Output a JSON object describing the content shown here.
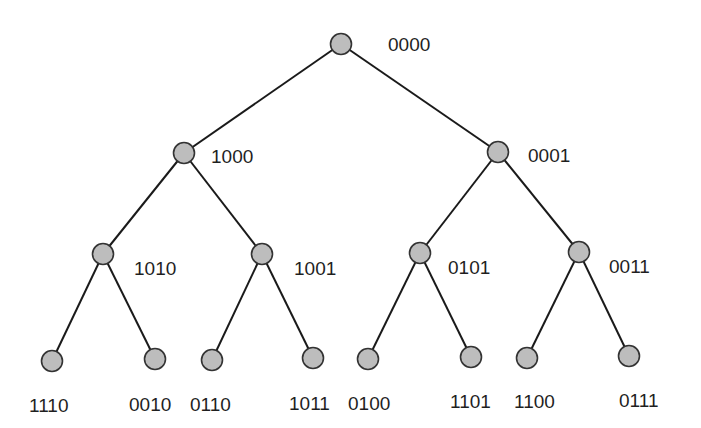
{
  "diagram": {
    "type": "binary-tree",
    "colors": {
      "node_fill": "#bdbdbd",
      "node_stroke": "#333333",
      "edge": "#1a1a1a",
      "text": "#1f1f1f"
    },
    "nodes": [
      {
        "id": "n0",
        "label": "0000",
        "x": 341,
        "y": 44,
        "lx": 388,
        "ly": 35
      },
      {
        "id": "n1",
        "label": "1000",
        "x": 184,
        "y": 153,
        "lx": 211,
        "ly": 147
      },
      {
        "id": "n2",
        "label": "0001",
        "x": 498,
        "y": 152,
        "lx": 528,
        "ly": 146
      },
      {
        "id": "n3",
        "label": "1010",
        "x": 103,
        "y": 254,
        "lx": 134,
        "ly": 259
      },
      {
        "id": "n4",
        "label": "1001",
        "x": 262,
        "y": 254,
        "lx": 294,
        "ly": 259
      },
      {
        "id": "n5",
        "label": "0101",
        "x": 420,
        "y": 253,
        "lx": 448,
        "ly": 258
      },
      {
        "id": "n6",
        "label": "0011",
        "x": 579,
        "y": 252,
        "lx": 609,
        "ly": 257
      },
      {
        "id": "n7",
        "label": "1110",
        "x": 52,
        "y": 361,
        "lx": 29,
        "ly": 396
      },
      {
        "id": "n8",
        "label": "0010",
        "x": 155,
        "y": 359,
        "lx": 129,
        "ly": 395
      },
      {
        "id": "n9",
        "label": "0110",
        "x": 212,
        "y": 360,
        "lx": 190,
        "ly": 395
      },
      {
        "id": "n10",
        "label": "1011",
        "x": 313,
        "y": 358,
        "lx": 289,
        "ly": 394
      },
      {
        "id": "n11",
        "label": "0100",
        "x": 368,
        "y": 359,
        "lx": 348,
        "ly": 394
      },
      {
        "id": "n12",
        "label": "1101",
        "x": 471,
        "y": 357,
        "lx": 450,
        "ly": 392
      },
      {
        "id": "n13",
        "label": "1100",
        "x": 527,
        "y": 358,
        "lx": 514,
        "ly": 392
      },
      {
        "id": "n14",
        "label": "0111",
        "x": 629,
        "y": 356,
        "lx": 619,
        "ly": 391
      }
    ],
    "edges": [
      [
        "n0",
        "n1"
      ],
      [
        "n0",
        "n2"
      ],
      [
        "n1",
        "n3"
      ],
      [
        "n1",
        "n4"
      ],
      [
        "n2",
        "n5"
      ],
      [
        "n2",
        "n6"
      ],
      [
        "n3",
        "n7"
      ],
      [
        "n3",
        "n8"
      ],
      [
        "n4",
        "n9"
      ],
      [
        "n4",
        "n10"
      ],
      [
        "n5",
        "n11"
      ],
      [
        "n5",
        "n12"
      ],
      [
        "n6",
        "n13"
      ],
      [
        "n6",
        "n14"
      ]
    ]
  }
}
